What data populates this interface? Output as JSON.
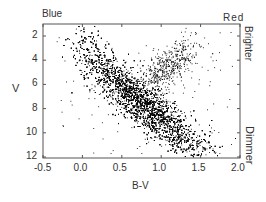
{
  "chart_data": {
    "type": "scatter",
    "title": "",
    "xlabel": "B-V",
    "ylabel": "V",
    "xlim": [
      -0.5,
      2.0
    ],
    "ylim": [
      12,
      1
    ],
    "y_inverted": true,
    "x_ticks": [
      -0.5,
      0.0,
      0.5,
      1.0,
      1.5,
      2.0
    ],
    "x_tick_labels": [
      "-0.5",
      "0.0",
      "0.5",
      "1.0",
      "1.5",
      "2.0"
    ],
    "y_ticks": [
      2,
      4,
      6,
      8,
      10,
      12
    ],
    "y_tick_labels": [
      "2",
      "4",
      "6",
      "8",
      "10",
      "12"
    ],
    "grid": false,
    "annotations": {
      "top_left": "Blue",
      "top_right": "Red",
      "right_top": "Brighter",
      "right_bottom": "Dimmer"
    },
    "point_color": "#000000",
    "series": [
      {
        "name": "main-sequence",
        "approx_points": [
          {
            "x": 0.0,
            "y": 2.5
          },
          {
            "x": 0.2,
            "y": 4.0
          },
          {
            "x": 0.4,
            "y": 6.0
          },
          {
            "x": 0.6,
            "y": 7.5
          },
          {
            "x": 0.8,
            "y": 8.5
          },
          {
            "x": 1.0,
            "y": 9.3
          },
          {
            "x": 1.2,
            "y": 10.0
          },
          {
            "x": 1.4,
            "y": 10.5
          },
          {
            "x": 1.6,
            "y": 11.0
          }
        ]
      },
      {
        "name": "giant-branch",
        "approx_points": [
          {
            "x": 0.9,
            "y": 5.5
          },
          {
            "x": 1.0,
            "y": 4.8
          },
          {
            "x": 1.1,
            "y": 4.2
          },
          {
            "x": 1.3,
            "y": 3.5
          }
        ]
      }
    ]
  }
}
